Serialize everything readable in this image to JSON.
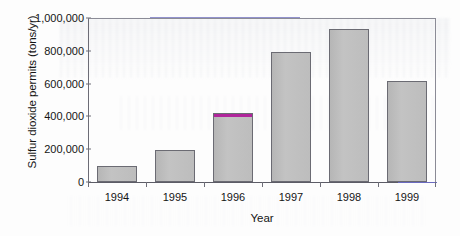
{
  "chart_data": {
    "type": "bar",
    "title": "",
    "categories": [
      "1994",
      "1995",
      "1996",
      "1997",
      "1998",
      "1999"
    ],
    "values": [
      95000,
      195000,
      420000,
      790000,
      930000,
      615000
    ],
    "xlabel": "Year",
    "ylabel": "Sulfur dioxide permits (tons/yr)",
    "ylim": [
      0,
      1000000
    ],
    "ytick_labels": [
      "0",
      "200,000",
      "400,000",
      "600,000",
      "800,000",
      "1,000,000"
    ],
    "ytick_values": [
      0,
      200000,
      400000,
      600000,
      800000,
      1000000
    ],
    "grid": false,
    "legend": null,
    "series": [
      {
        "name": "Sulfur dioxide permits",
        "values": [
          95000,
          195000,
          420000,
          790000,
          930000,
          615000
        ]
      }
    ],
    "annotations": [
      {
        "category": "1996",
        "note": "bar top capped with magenta highlight"
      }
    ]
  },
  "style": {
    "bar_fill": "#bdbdbd",
    "bar_edge": "#6b6b73",
    "highlight": "#b0259b",
    "axis": "#6e6e78",
    "text": "#151515",
    "rule_accent": "#7f7fc4"
  }
}
